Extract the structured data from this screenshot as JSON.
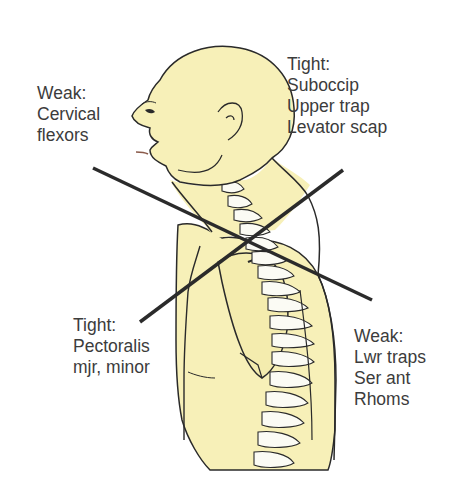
{
  "diagram": {
    "colors": {
      "skin": "#f7f0b8",
      "skin_shadow": "#efe39a",
      "outline": "#2a2a2a",
      "bone": "#fbfbf4",
      "cross_lines": "#2b2b2b",
      "text": "#3c3c3c",
      "background": "#ffffff"
    },
    "labels": [
      {
        "id": "weak-cervical",
        "heading": "Weak:",
        "lines": [
          "Cervical",
          "flexors"
        ]
      },
      {
        "id": "tight-upper",
        "heading": "Tight:",
        "lines": [
          "Suboccip",
          "Upper trap",
          "Levator scap"
        ]
      },
      {
        "id": "tight-pec",
        "heading": "Tight:",
        "lines": [
          "Pectoralis",
          "mjr, minor"
        ]
      },
      {
        "id": "weak-lower",
        "heading": "Weak:",
        "lines": [
          "Lwr traps",
          "Ser ant",
          "Rhoms"
        ]
      }
    ],
    "cross_lines": [
      {
        "name": "weak-diagonal",
        "from": [
          93,
          168
        ],
        "to": [
          372,
          300
        ]
      },
      {
        "name": "tight-diagonal",
        "from": [
          343,
          170
        ],
        "to": [
          140,
          322
        ]
      }
    ]
  }
}
